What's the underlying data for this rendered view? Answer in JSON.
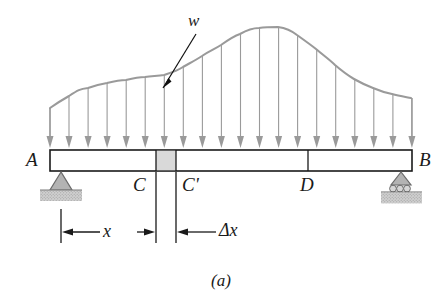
{
  "figure": {
    "caption": "(a)",
    "type": "beam-distributed-load-diagram",
    "colors": {
      "load_gray": "#9a9a9a",
      "beam_outline": "#1a1a1a",
      "element_fill": "#d9d9d9",
      "support_fill": "#b3b3b3",
      "ground_fill": "#c9c9c9",
      "leader_black": "#111111"
    },
    "labels": {
      "support_left": "A",
      "support_right": "B",
      "section_c": "C",
      "section_c_prime": "C'",
      "section_d": "D",
      "load_intensity": "w",
      "dim_x": "x",
      "dim_delta_x": "Δx"
    },
    "beam": {
      "left_x": 50,
      "right_x": 412,
      "top_y": 150,
      "bottom_y": 171,
      "division_lines_x": [
        156,
        176,
        308
      ],
      "element_fill_from_x": 156,
      "element_fill_to_x": 176
    },
    "supports": {
      "left": {
        "type": "pin",
        "x": 61
      },
      "right": {
        "type": "roller",
        "x": 401
      }
    },
    "load_curve": {
      "description": "wavy distributed load, local shoulder near C then rising to peak near D-left then decaying",
      "baseline_y": 150,
      "points": [
        [
          50,
          108
        ],
        [
          63,
          99
        ],
        [
          78,
          92
        ],
        [
          95,
          86
        ],
        [
          112,
          82
        ],
        [
          130,
          79
        ],
        [
          146,
          77
        ],
        [
          157,
          76
        ],
        [
          168,
          74
        ],
        [
          182,
          68
        ],
        [
          196,
          60
        ],
        [
          212,
          49
        ],
        [
          230,
          38
        ],
        [
          248,
          30
        ],
        [
          266,
          27
        ],
        [
          282,
          28
        ],
        [
          296,
          34
        ],
        [
          310,
          44
        ],
        [
          324,
          57
        ],
        [
          338,
          68
        ],
        [
          352,
          78
        ],
        [
          366,
          86
        ],
        [
          382,
          92
        ],
        [
          398,
          96
        ],
        [
          412,
          98
        ]
      ],
      "arrow_count": 20,
      "arrow_first_x": 50,
      "arrow_spacing": 19.05
    },
    "dimensions": {
      "tick_left_x": 61,
      "tick_c_x": 156,
      "tick_cprime_x": 176,
      "dim_line_y": 232,
      "x_label_x": 110,
      "delta_x_label_x": 225
    }
  }
}
